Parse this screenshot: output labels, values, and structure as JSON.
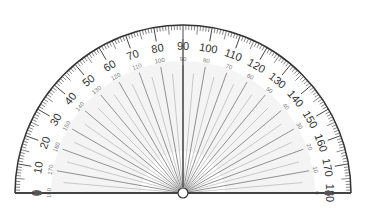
{
  "protractor": {
    "outer_scale": [
      "0",
      "10",
      "20",
      "30",
      "40",
      "50",
      "60",
      "70",
      "80",
      "90",
      "100",
      "110",
      "120",
      "130",
      "140",
      "150",
      "160",
      "170",
      "180"
    ],
    "inner_scale": [
      "180",
      "170",
      "160",
      "150",
      "140",
      "130",
      "120",
      "110",
      "100",
      "90",
      "80",
      "70",
      "60",
      "50",
      "40",
      "30",
      "20",
      "10",
      "0"
    ],
    "colors": {
      "stroke": "#333333",
      "ray": "#888888",
      "fill": "#f4f4f4",
      "text": "#333333",
      "inner_text": "#777777"
    }
  }
}
